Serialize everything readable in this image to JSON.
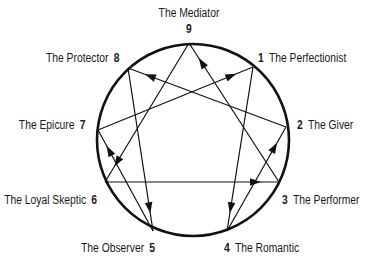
{
  "colors": {
    "line": "#111111",
    "circle": "#111111",
    "text": "#1a1a1a",
    "background": "#ffffff"
  },
  "circle": {
    "cx": 193,
    "cy": 140,
    "r": 96
  },
  "points": [
    {
      "num": "9",
      "name": "The Mediator",
      "x": 189,
      "y": 43
    },
    {
      "num": "1",
      "name": "The Perfectionist",
      "x": 253,
      "y": 67
    },
    {
      "num": "2",
      "name": "The Giver",
      "x": 286,
      "y": 127
    },
    {
      "num": "3",
      "name": "The Performer",
      "x": 279,
      "y": 182
    },
    {
      "num": "4",
      "name": "The Romantic",
      "x": 227,
      "y": 231
    },
    {
      "num": "5",
      "name": "The Observer",
      "x": 153,
      "y": 231
    },
    {
      "num": "6",
      "name": "The Loyal Skeptic",
      "x": 105,
      "y": 182
    },
    {
      "num": "7",
      "name": "The Epicure",
      "x": 98,
      "y": 130
    },
    {
      "num": "8",
      "name": "The Protector",
      "x": 128,
      "y": 68
    }
  ],
  "arrows": [
    {
      "from": "9",
      "to": "6"
    },
    {
      "from": "6",
      "to": "3"
    },
    {
      "from": "3",
      "to": "9"
    },
    {
      "from": "1",
      "to": "4"
    },
    {
      "from": "4",
      "to": "2"
    },
    {
      "from": "2",
      "to": "8"
    },
    {
      "from": "8",
      "to": "5"
    },
    {
      "from": "5",
      "to": "7"
    },
    {
      "from": "7",
      "to": "1"
    }
  ],
  "labels": {
    "p9": {
      "num": "9",
      "name": "The Mediator"
    },
    "p1": {
      "num": "1",
      "name": "The Perfectionist"
    },
    "p2": {
      "num": "2",
      "name": "The Giver"
    },
    "p3": {
      "num": "3",
      "name": "The Performer"
    },
    "p4": {
      "num": "4",
      "name": "The Romantic"
    },
    "p5": {
      "num": "5",
      "name": "The Observer"
    },
    "p6": {
      "num": "6",
      "name": "The Loyal Skeptic"
    },
    "p7": {
      "num": "7",
      "name": "The Epicure"
    },
    "p8": {
      "num": "8",
      "name": "The Protector"
    }
  }
}
